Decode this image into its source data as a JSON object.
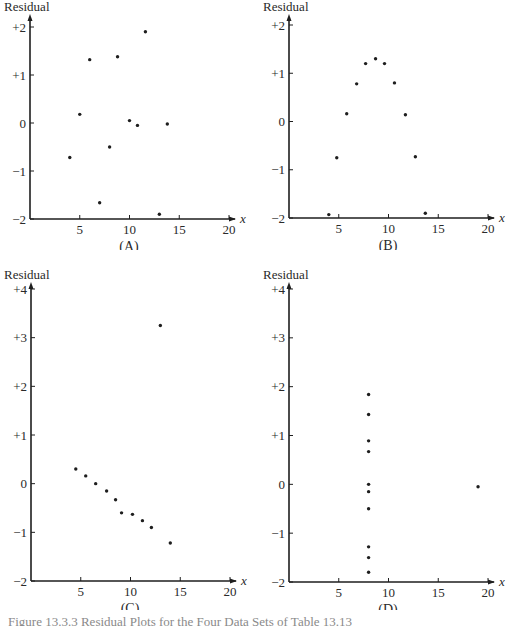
{
  "caption": "Figure 13.3.3 Residual Plots for the Four Data Sets of Table 13.13",
  "chart_data": [
    {
      "type": "scatter",
      "panel_label": "(A)",
      "title": "",
      "xlabel": "x",
      "ylabel": "Residual",
      "xlim": [
        0,
        20
      ],
      "ylim": [
        -2,
        2
      ],
      "x_ticks": [
        5,
        10,
        15,
        20
      ],
      "y_ticks": [
        -2,
        -1,
        0,
        1,
        2
      ],
      "y_tick_labels": [
        "−2",
        "−1",
        "0",
        "+1",
        "+2"
      ],
      "grid": false,
      "points": [
        [
          4,
          -0.72
        ],
        [
          5,
          0.18
        ],
        [
          6,
          1.32
        ],
        [
          7,
          -1.66
        ],
        [
          8,
          -0.5
        ],
        [
          8.8,
          1.38
        ],
        [
          10,
          0.05
        ],
        [
          10.8,
          -0.05
        ],
        [
          11.6,
          1.9
        ],
        [
          13,
          -1.9
        ],
        [
          13.8,
          -0.02
        ]
      ]
    },
    {
      "type": "scatter",
      "panel_label": "(B)",
      "title": "",
      "xlabel": "x",
      "ylabel": "Residual",
      "xlim": [
        0,
        20
      ],
      "ylim": [
        -2,
        2
      ],
      "x_ticks": [
        5,
        10,
        15,
        20
      ],
      "y_ticks": [
        -2,
        -1,
        0,
        1,
        2
      ],
      "y_tick_labels": [
        "−2",
        "−1",
        "0",
        "+1",
        "+2"
      ],
      "grid": false,
      "points": [
        [
          4,
          -1.93
        ],
        [
          4.8,
          -0.75
        ],
        [
          5.8,
          0.16
        ],
        [
          6.8,
          0.78
        ],
        [
          7.7,
          1.2
        ],
        [
          8.7,
          1.3
        ],
        [
          9.6,
          1.2
        ],
        [
          10.6,
          0.8
        ],
        [
          11.7,
          0.14
        ],
        [
          12.7,
          -0.73
        ],
        [
          13.7,
          -1.9
        ]
      ]
    },
    {
      "type": "scatter",
      "panel_label": "(C)",
      "title": "",
      "xlabel": "x",
      "ylabel": "Residual",
      "xlim": [
        0,
        20
      ],
      "ylim": [
        -2,
        4
      ],
      "x_ticks": [
        5,
        10,
        15,
        20
      ],
      "y_ticks": [
        -2,
        -1,
        0,
        1,
        2,
        3,
        4
      ],
      "y_tick_labels": [
        "−2",
        "−1",
        "0",
        "+1",
        "+2",
        "+3",
        "+4"
      ],
      "grid": false,
      "points": [
        [
          4.5,
          0.3
        ],
        [
          5.5,
          0.16
        ],
        [
          6.5,
          0
        ],
        [
          7.6,
          -0.15
        ],
        [
          8.5,
          -0.33
        ],
        [
          9.1,
          -0.6
        ],
        [
          10.2,
          -0.63
        ],
        [
          11.2,
          -0.76
        ],
        [
          12.1,
          -0.9
        ],
        [
          13,
          3.25
        ],
        [
          14,
          -1.22
        ]
      ]
    },
    {
      "type": "scatter",
      "panel_label": "(D)",
      "title": "",
      "xlabel": "x",
      "ylabel": "Residual",
      "xlim": [
        0,
        20
      ],
      "ylim": [
        -2,
        4
      ],
      "x_ticks": [
        5,
        10,
        15,
        20
      ],
      "y_ticks": [
        -2,
        -1,
        0,
        1,
        2,
        3,
        4
      ],
      "y_tick_labels": [
        "−2",
        "−1",
        "0",
        "+1",
        "+2",
        "+3",
        "+4"
      ],
      "grid": false,
      "points": [
        [
          8,
          1.84
        ],
        [
          8,
          1.43
        ],
        [
          8,
          0.89
        ],
        [
          8,
          0.67
        ],
        [
          8,
          0
        ],
        [
          8,
          -0.15
        ],
        [
          8,
          -0.5
        ],
        [
          8,
          -1.28
        ],
        [
          8,
          -1.5
        ],
        [
          8,
          -1.8
        ],
        [
          19,
          -0.05
        ]
      ]
    }
  ],
  "layout": [
    {
      "left": 0,
      "top": 0,
      "axisX": 30,
      "yTop": 14,
      "yMin": -2,
      "yMax": 2,
      "pxTop": 27,
      "pxBottom": 219
    },
    {
      "left": 259,
      "top": 0,
      "axisX": 30,
      "yTop": 14,
      "yMin": -2,
      "yMax": 2,
      "pxTop": 25,
      "pxBottom": 218
    },
    {
      "left": 0,
      "top": 260,
      "axisX": 31,
      "yTop": 22,
      "yMin": -2,
      "yMax": 4,
      "pxTop": 29,
      "pxBottom": 321
    },
    {
      "left": 259,
      "top": 260,
      "axisX": 30,
      "yTop": 22,
      "yMin": -2,
      "yMax": 4,
      "pxTop": 29,
      "pxBottom": 322
    }
  ],
  "colors": {
    "ink": "#1e1e1e",
    "caption": "#8a8a8a"
  }
}
